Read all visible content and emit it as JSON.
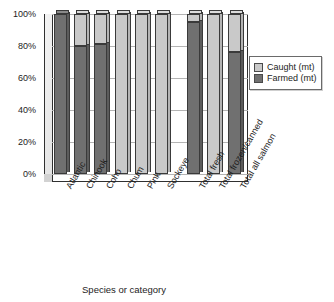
{
  "chart_data": {
    "type": "bar",
    "subtype": "100% stacked column (3-D)",
    "title": "",
    "xlabel": "Species or category",
    "ylabel": "",
    "ylim": [
      0,
      100
    ],
    "yticks": [
      "0%",
      "20%",
      "40%",
      "60%",
      "80%",
      "100%"
    ],
    "ytick_values": [
      0,
      20,
      40,
      60,
      80,
      100
    ],
    "grid": "horizontal",
    "legend_position": "right",
    "units": "percent",
    "categories": [
      "Atlantic",
      "Chinook",
      "Coho",
      "Chum",
      "Pink",
      "Sockeye",
      "Total fresh",
      "Total frozen/canned",
      "Total all salmon"
    ],
    "series": [
      {
        "name": "Caught (mt)",
        "color": "#c9c9c9",
        "values": [
          0,
          20,
          19,
          100,
          100,
          100,
          5,
          100,
          24
        ]
      },
      {
        "name": "Farmed (mt)",
        "color": "#707070",
        "values": [
          100,
          80,
          81,
          0,
          0,
          0,
          95,
          0,
          76
        ]
      }
    ],
    "gap_after_category_index": 5
  },
  "legend": {
    "items": [
      {
        "label": "Caught (mt)",
        "color": "#c9c9c9"
      },
      {
        "label": "Farmed (mt)",
        "color": "#707070"
      }
    ]
  },
  "axes": {
    "x_title": "Species or category"
  }
}
